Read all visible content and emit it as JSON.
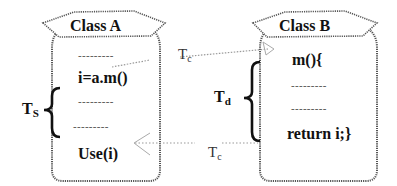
{
  "diagram": {
    "class_a": {
      "title": "Class A",
      "lines": [
        "---------",
        "i=a.m()",
        "---------",
        "---------",
        "Use(i)"
      ]
    },
    "class_b": {
      "title": "Class B",
      "lines": [
        "m(){",
        "---------",
        "---------",
        "return i;}"
      ]
    },
    "labels": {
      "ts_main": "T",
      "ts_sub": "S",
      "td_main": "T",
      "td_sub": "d",
      "tc_call_main": "T",
      "tc_call_sub": "c",
      "tc_return_main": "T",
      "tc_return_sub": "c"
    },
    "arrows": [
      {
        "from": "Class A: i=a.m()",
        "to": "Class B: m(){",
        "label": "Tc",
        "style": "dotted"
      },
      {
        "from": "Class B: return i;}",
        "to": "Class A: Use(i)",
        "label": "Tc",
        "style": "dotted"
      }
    ],
    "colors": {
      "outline": "#555555",
      "text": "#111111",
      "arrow": "#999999",
      "brace": "#111111"
    }
  }
}
